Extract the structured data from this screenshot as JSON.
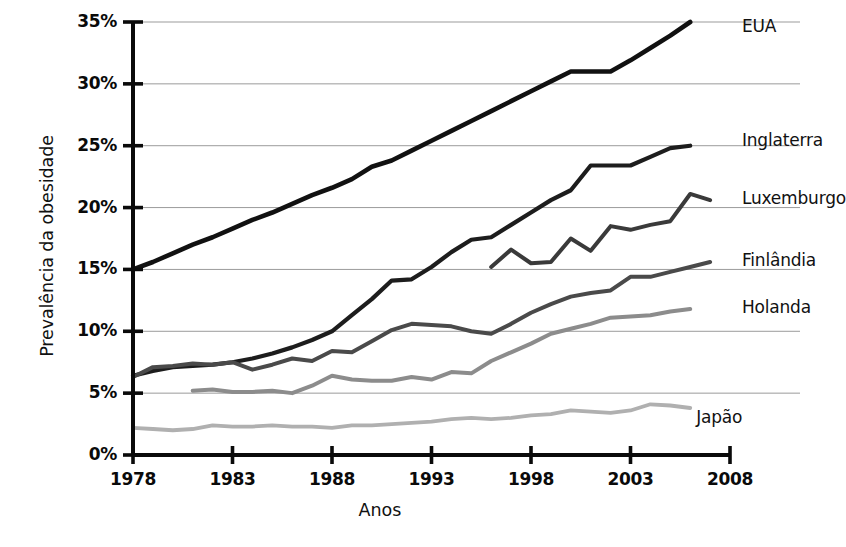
{
  "chart_data": {
    "type": "line",
    "title": "",
    "xlabel": "Anos",
    "ylabel": "Prevalência da obesidade",
    "xlim": [
      1978,
      2008
    ],
    "ylim": [
      0,
      35
    ],
    "grid": true,
    "legend_position": "right-inline",
    "x_ticks": [
      "1978",
      "1983",
      "1988",
      "1993",
      "1998",
      "2003",
      "2008"
    ],
    "y_ticks": [
      "0%",
      "5%",
      "10%",
      "15%",
      "20%",
      "25%",
      "30%",
      "35%"
    ],
    "series": [
      {
        "name": "EUA",
        "color": "#111111",
        "width": 4.6,
        "label_x": 2008.3,
        "label_y": 34.6,
        "x": [
          1978,
          1979,
          1980,
          1981,
          1982,
          1983,
          1984,
          1985,
          1986,
          1987,
          1988,
          1989,
          1990,
          1991,
          1992,
          1993,
          1994,
          1995,
          1996,
          1997,
          1998,
          1999,
          2000,
          2001,
          2002,
          2003,
          2004,
          2005,
          2006
        ],
        "values": [
          15.0,
          15.6,
          16.3,
          17.0,
          17.6,
          18.3,
          19.0,
          19.6,
          20.3,
          21.0,
          21.6,
          22.3,
          23.3,
          23.8,
          24.6,
          25.4,
          26.2,
          27.0,
          27.8,
          28.6,
          29.4,
          30.2,
          31.0,
          31.0,
          31.0,
          31.9,
          32.9,
          33.9,
          35.0
        ]
      },
      {
        "name": "Inglaterra",
        "color": "#1d1d1d",
        "width": 4.2,
        "label_x": 2008.3,
        "label_y": 25.4,
        "x": [
          1978,
          1979,
          1980,
          1981,
          1982,
          1983,
          1984,
          1985,
          1986,
          1987,
          1988,
          1989,
          1990,
          1991,
          1992,
          1993,
          1994,
          1995,
          1996,
          1997,
          1998,
          1999,
          2000,
          2001,
          2002,
          2003,
          2004,
          2005,
          2006
        ],
        "values": [
          6.4,
          6.8,
          7.1,
          7.2,
          7.3,
          7.5,
          7.8,
          8.2,
          8.7,
          9.3,
          10.0,
          11.3,
          12.6,
          14.1,
          14.2,
          15.2,
          16.4,
          17.4,
          17.6,
          18.6,
          19.6,
          20.6,
          21.4,
          23.4,
          23.4,
          23.4,
          24.1,
          24.8,
          25.0
        ]
      },
      {
        "name": "Luxemburgo",
        "color": "#3a3a3a",
        "width": 4.0,
        "label_x": 2008.3,
        "label_y": 20.7,
        "x": [
          1996,
          1997,
          1998,
          1999,
          2000,
          2001,
          2002,
          2003,
          2004,
          2005,
          2006,
          2007
        ],
        "values": [
          15.2,
          16.6,
          15.5,
          15.6,
          17.5,
          16.5,
          18.5,
          18.2,
          18.6,
          18.9,
          21.1,
          20.6
        ]
      },
      {
        "name": "Finlândia",
        "color": "#4a4a4a",
        "width": 4.0,
        "label_x": 2008.3,
        "label_y": 15.7,
        "x": [
          1978,
          1979,
          1980,
          1981,
          1982,
          1983,
          1984,
          1985,
          1986,
          1987,
          1988,
          1989,
          1990,
          1991,
          1992,
          1993,
          1994,
          1995,
          1996,
          1997,
          1998,
          1999,
          2000,
          2001,
          2002,
          2003,
          2004,
          2005,
          2006,
          2007
        ],
        "values": [
          6.3,
          7.1,
          7.2,
          7.4,
          7.3,
          7.5,
          6.9,
          7.3,
          7.8,
          7.6,
          8.4,
          8.3,
          9.2,
          10.1,
          10.6,
          10.5,
          10.4,
          10.0,
          9.8,
          10.6,
          11.5,
          12.2,
          12.8,
          13.1,
          13.3,
          14.4,
          14.4,
          14.8,
          15.2,
          15.6
        ]
      },
      {
        "name": "Holanda",
        "color": "#8c8c8c",
        "width": 4.0,
        "label_x": 2008.3,
        "label_y": 11.9,
        "x": [
          1981,
          1982,
          1983,
          1984,
          1985,
          1986,
          1987,
          1988,
          1989,
          1990,
          1991,
          1992,
          1993,
          1994,
          1995,
          1996,
          1997,
          1998,
          1999,
          2000,
          2001,
          2002,
          2003,
          2004,
          2005,
          2006
        ],
        "values": [
          5.2,
          5.3,
          5.1,
          5.1,
          5.2,
          5.0,
          5.6,
          6.4,
          6.1,
          6.0,
          6.0,
          6.3,
          6.1,
          6.7,
          6.6,
          7.6,
          8.3,
          9.0,
          9.8,
          10.2,
          10.6,
          11.1,
          11.2,
          11.3,
          11.6,
          11.8
        ]
      },
      {
        "name": "Japão",
        "color": "#b0b0b0",
        "width": 3.8,
        "label_x": 2006.0,
        "label_y": 3.0,
        "x": [
          1978,
          1979,
          1980,
          1981,
          1982,
          1983,
          1984,
          1985,
          1986,
          1987,
          1988,
          1989,
          1990,
          1991,
          1992,
          1993,
          1994,
          1995,
          1996,
          1997,
          1998,
          1999,
          2000,
          2001,
          2002,
          2003,
          2004,
          2005,
          2006
        ],
        "values": [
          2.2,
          2.1,
          2.0,
          2.1,
          2.4,
          2.3,
          2.3,
          2.4,
          2.3,
          2.3,
          2.2,
          2.4,
          2.4,
          2.5,
          2.6,
          2.7,
          2.9,
          3.0,
          2.9,
          3.0,
          3.2,
          3.3,
          3.6,
          3.5,
          3.4,
          3.6,
          4.1,
          4.0,
          3.8
        ]
      }
    ]
  }
}
